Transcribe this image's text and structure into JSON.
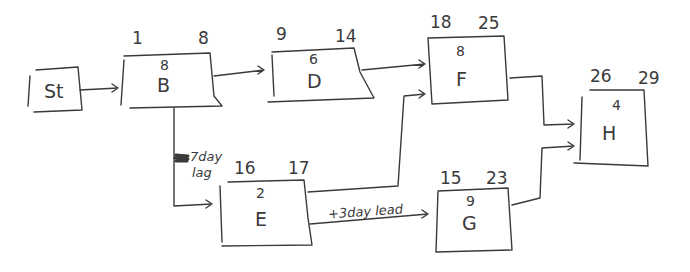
{
  "diagram": {
    "type": "activity-network-diagram",
    "stroke_color": "#3a3a3a",
    "nodes": [
      {
        "id": "St",
        "label": "St",
        "duration": "",
        "start": "",
        "end": ""
      },
      {
        "id": "B",
        "label": "B",
        "duration": "8",
        "start": "1",
        "end": "8"
      },
      {
        "id": "D",
        "label": "D",
        "duration": "6",
        "start": "9",
        "end": "14"
      },
      {
        "id": "F",
        "label": "F",
        "duration": "8",
        "start": "18",
        "end": "25"
      },
      {
        "id": "E",
        "label": "E",
        "duration": "2",
        "start": "16",
        "end": "17"
      },
      {
        "id": "G",
        "label": "G",
        "duration": "9",
        "start": "15",
        "end": "23"
      },
      {
        "id": "H",
        "label": "H",
        "duration": "4",
        "start": "26",
        "end": "29"
      }
    ],
    "edges": [
      {
        "from": "St",
        "to": "B",
        "label": ""
      },
      {
        "from": "B",
        "to": "D",
        "label": ""
      },
      {
        "from": "D",
        "to": "F",
        "label": ""
      },
      {
        "from": "B",
        "to": "E",
        "label": "+7day lag"
      },
      {
        "from": "E",
        "to": "F",
        "label": ""
      },
      {
        "from": "E",
        "to": "G",
        "label": "+3day lead"
      },
      {
        "from": "F",
        "to": "H",
        "label": ""
      },
      {
        "from": "G",
        "to": "H",
        "label": ""
      }
    ],
    "annotations": {
      "lag_line1": "7day",
      "lag_line2": "lag",
      "lead": "+3day lead"
    }
  }
}
